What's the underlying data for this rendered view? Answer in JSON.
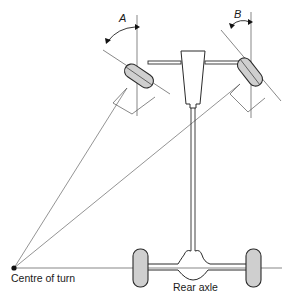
{
  "diagram": {
    "type": "steering-geometry",
    "labels": {
      "angle_inner": "A",
      "angle_outer": "B",
      "centre_of_turn": "Centre of turn",
      "rear_axle": "Rear axle"
    },
    "colors": {
      "line": "#333333",
      "tyre_fill": "#cfcfcf",
      "tyre_stroke": "#2a2a2a",
      "thin_line": "#555555"
    }
  }
}
